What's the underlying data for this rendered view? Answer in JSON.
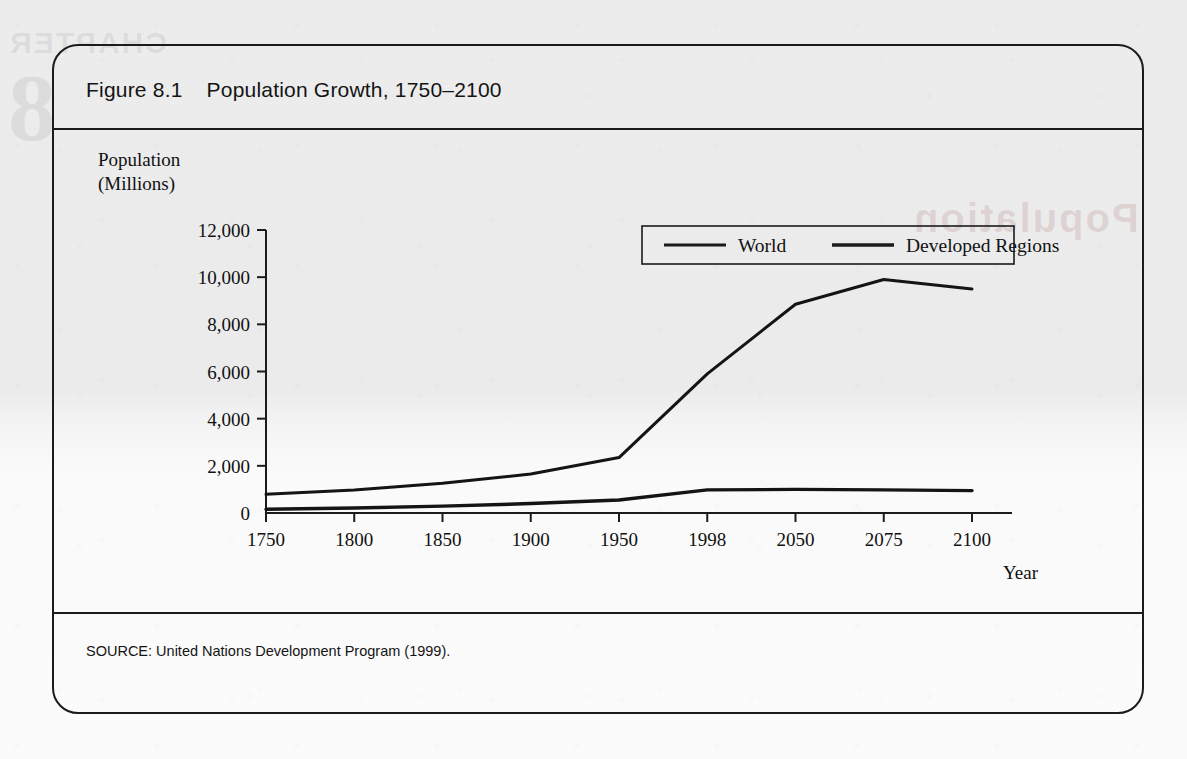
{
  "figure": {
    "number_label": "Figure 8.1",
    "title": "Population Growth, 1750–2100",
    "source": "SOURCE: United Nations Development Program (1999)."
  },
  "watermarks": {
    "chapter_word": "CHAPTER",
    "chapter_number": "8",
    "section_word": "Population"
  },
  "axes": {
    "y_title_line1": "Population",
    "y_title_line2": "(Millions)",
    "x_title": "Year"
  },
  "colors": {
    "ink": "#1b1b1b",
    "series_world": "#141414",
    "series_developed": "#141414",
    "frame": "#1b1b1b"
  },
  "chart_data": {
    "type": "line",
    "title": "Population Growth, 1750–2100",
    "xlabel": "Year",
    "ylabel": "Population (Millions)",
    "categories": [
      "1750",
      "1800",
      "1850",
      "1900",
      "1950",
      "1998",
      "2050",
      "2075",
      "2100"
    ],
    "ylim": [
      0,
      12000
    ],
    "ytick_labels": [
      "0",
      "2,000",
      "4,000",
      "6,000",
      "8,000",
      "10,000",
      "12,000"
    ],
    "ytick_values": [
      0,
      2000,
      4000,
      6000,
      8000,
      10000,
      12000
    ],
    "grid": false,
    "legend_position": "top-right-inside",
    "series": [
      {
        "name": "World",
        "values": [
          790,
          980,
          1260,
          1650,
          2350,
          5900,
          8850,
          9900,
          9500
        ]
      },
      {
        "name": "Developed Regions",
        "values": [
          160,
          210,
          290,
          400,
          550,
          980,
          1000,
          980,
          950
        ]
      }
    ]
  }
}
